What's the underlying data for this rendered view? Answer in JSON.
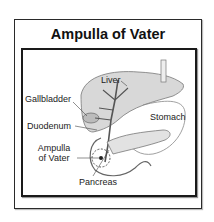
{
  "title": "Ampulla of Vater",
  "labels": {
    "liver": "Liver",
    "gallbladder": "Gallbladder",
    "stomach": "Stomach",
    "duodenum": "Duodenum",
    "ampulla_line1": "Ampulla",
    "ampulla_line2": "of Vater",
    "pancreas": "Pancreas"
  }
}
